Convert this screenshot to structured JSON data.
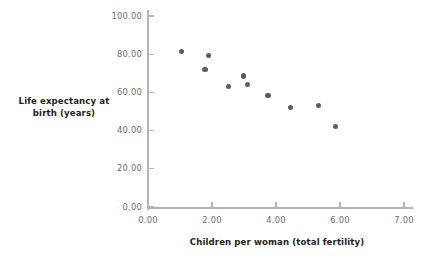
{
  "chart_data": {
    "type": "scatter",
    "title": "",
    "xlabel": "Children per woman (total fertility)",
    "ylabel_line1": "Life expectancy at",
    "ylabel_line2": "birth (years)",
    "xlim": [
      0.0,
      8.0
    ],
    "ylim": [
      0.0,
      100.0
    ],
    "grid": false,
    "legend": "none",
    "marker_color": "#5d5d5d",
    "axis_color": "#b5b5b5",
    "tick_label_color": "#6d6d6d",
    "axis_title_color": "#231f20",
    "xticks": [
      {
        "value": 0.0,
        "label": "0.00"
      },
      {
        "value": 2.0,
        "label": "2.00"
      },
      {
        "value": 4.0,
        "label": "4.00"
      },
      {
        "value": 6.0,
        "label": "6.00"
      },
      {
        "value": 8.0,
        "label": "7.00"
      }
    ],
    "yticks": [
      {
        "value": 0.0,
        "label": "0.00"
      },
      {
        "value": 20.0,
        "label": "20.00"
      },
      {
        "value": 40.0,
        "label": "40.00"
      },
      {
        "value": 60.0,
        "label": "60.00"
      },
      {
        "value": 80.0,
        "label": "80.00"
      },
      {
        "value": 100.0,
        "label": "100.00"
      }
    ],
    "points": [
      {
        "x": 1.05,
        "y": 81.5
      },
      {
        "x": 1.78,
        "y": 72.0
      },
      {
        "x": 1.88,
        "y": 79.3
      },
      {
        "x": 2.52,
        "y": 63.2
      },
      {
        "x": 2.98,
        "y": 68.6
      },
      {
        "x": 3.1,
        "y": 64.2
      },
      {
        "x": 3.75,
        "y": 58.2
      },
      {
        "x": 4.45,
        "y": 52.0
      },
      {
        "x": 5.32,
        "y": 53.0
      },
      {
        "x": 5.85,
        "y": 42.0
      }
    ]
  }
}
